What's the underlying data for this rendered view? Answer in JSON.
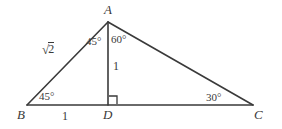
{
  "figure": {
    "type": "geometry-diagram",
    "background_color": "#ffffff",
    "stroke_color": "#3a3a3a",
    "points": {
      "A": {
        "x": 108,
        "y": 22
      },
      "B": {
        "x": 27,
        "y": 105
      },
      "D": {
        "x": 108,
        "y": 105
      },
      "C": {
        "x": 253,
        "y": 105
      }
    },
    "segments": [
      {
        "name": "AB",
        "from": "A",
        "to": "B"
      },
      {
        "name": "AC",
        "from": "A",
        "to": "C"
      },
      {
        "name": "BC",
        "from": "B",
        "to": "C"
      },
      {
        "name": "AD",
        "from": "A",
        "to": "D"
      }
    ],
    "vertex_labels": {
      "A": "A",
      "B": "B",
      "C": "C",
      "D": "D"
    },
    "angle_labels": {
      "at_A_left": "45°",
      "at_A_right": "60°",
      "at_B": "45°",
      "at_C": "30°"
    },
    "side_labels": {
      "AB": "√2",
      "AB_radical_sign": "√",
      "AB_radicand": "2",
      "AD": "1",
      "BD": "1"
    },
    "right_angle_marker": {
      "at": "D",
      "size": 8
    }
  }
}
